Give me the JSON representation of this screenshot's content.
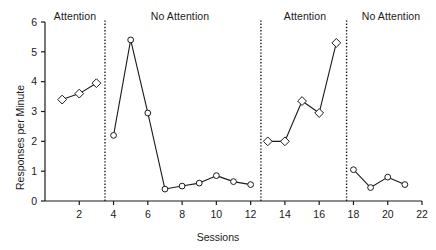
{
  "figure": {
    "background_color": "#ffffff",
    "line_color": "#1a1a1a",
    "marker_fill": "#ffffff"
  },
  "labels": {
    "phase_1": "Attention",
    "phase_2": "No Attention",
    "phase_3": "Attention",
    "phase_4": "No Attention",
    "x_axis_title": "Sessions",
    "y_axis_title": "Responses per Minute"
  },
  "ticks": {
    "x": [
      "2",
      "4",
      "6",
      "8",
      "10",
      "12",
      "14",
      "16",
      "18",
      "20",
      "22"
    ],
    "y": [
      "0",
      "1",
      "2",
      "3",
      "4",
      "5",
      "6"
    ]
  },
  "chart_data": {
    "type": "line",
    "title": "",
    "subtitle": "",
    "xlabel": "Sessions",
    "ylabel": "Responses per Minute",
    "xlim": [
      0,
      22
    ],
    "ylim": [
      0,
      6
    ],
    "xticks": [
      2,
      4,
      6,
      8,
      10,
      12,
      14,
      16,
      18,
      20,
      22
    ],
    "yticks": [
      0,
      1,
      2,
      3,
      4,
      5,
      6
    ],
    "grid": false,
    "legend": null,
    "legend_position": "none",
    "phase_labels": [
      "Attention",
      "No Attention",
      "Attention",
      "No Attention"
    ],
    "phase_dividers": [
      3.5,
      12.6,
      17.6
    ],
    "series": [
      {
        "name": "Attention phase 1",
        "marker": "diamond",
        "x": [
          1,
          2,
          3
        ],
        "values": [
          3.4,
          3.6,
          3.95
        ]
      },
      {
        "name": "No Attention phase 1",
        "marker": "circle",
        "x": [
          4,
          5,
          6,
          7,
          8,
          9,
          10,
          11,
          12
        ],
        "values": [
          2.2,
          5.4,
          2.95,
          0.4,
          0.5,
          0.6,
          0.85,
          0.65,
          0.55
        ]
      },
      {
        "name": "Attention phase 2",
        "marker": "diamond",
        "x": [
          13,
          14,
          15,
          16,
          17
        ],
        "values": [
          2.0,
          2.0,
          3.35,
          2.95,
          5.3
        ]
      },
      {
        "name": "No Attention phase 2",
        "marker": "circle",
        "x": [
          18,
          19,
          20,
          21
        ],
        "values": [
          1.05,
          0.45,
          0.8,
          0.55
        ]
      }
    ]
  }
}
